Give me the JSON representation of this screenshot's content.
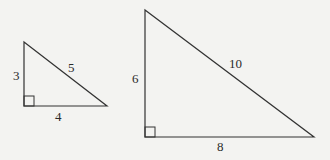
{
  "figure": {
    "triangles": [
      {
        "name": "small",
        "legs": {
          "vertical": "3",
          "horizontal": "4"
        },
        "hypotenuse": "5"
      },
      {
        "name": "large",
        "legs": {
          "vertical": "6",
          "horizontal": "8"
        },
        "hypotenuse": "10"
      }
    ]
  }
}
